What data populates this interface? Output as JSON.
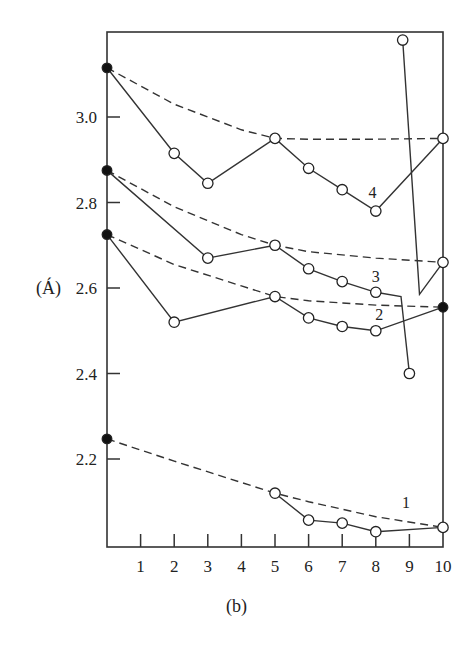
{
  "chart_data": {
    "type": "line",
    "title": "",
    "caption": "(b)",
    "xlabel": "",
    "ylabel": "(Á)",
    "xlim": [
      0,
      10
    ],
    "ylim": [
      1.98,
      3.22
    ],
    "x_ticks": [
      1,
      2,
      3,
      4,
      5,
      6,
      7,
      8,
      9,
      10
    ],
    "y_ticks": [
      2.2,
      2.4,
      2.6,
      2.8,
      3.0
    ],
    "y_tick_labels": [
      "2.2",
      "2.4",
      "2.6",
      "2.8",
      "3.0"
    ],
    "grid": false,
    "legend": "inline numeric labels 1-4",
    "series": [
      {
        "name": "1",
        "label_pos": [
          8.9,
          2.085
        ],
        "points": [
          [
            0,
            2.247,
            "filled"
          ],
          [
            5,
            2.12,
            "open"
          ],
          [
            6,
            2.057,
            "open"
          ],
          [
            7,
            2.05,
            "open"
          ],
          [
            8,
            2.03,
            "open"
          ],
          [
            10,
            2.04,
            "open"
          ]
        ],
        "solid_from_index": 1,
        "dashed_fit": [
          [
            0,
            2.247
          ],
          [
            2,
            2.195
          ],
          [
            4,
            2.145
          ],
          [
            5,
            2.12
          ],
          [
            6,
            2.1
          ],
          [
            8,
            2.065
          ],
          [
            10,
            2.04
          ]
        ]
      },
      {
        "name": "2",
        "label_pos": [
          8.1,
          2.525
        ],
        "points": [
          [
            0,
            2.725,
            "filled"
          ],
          [
            2,
            2.52,
            "open"
          ],
          [
            5,
            2.58,
            "open"
          ],
          [
            6,
            2.53,
            "open"
          ],
          [
            7,
            2.51,
            "open"
          ],
          [
            8,
            2.5,
            "open"
          ],
          [
            10,
            2.555,
            "filled"
          ]
        ],
        "solid_from_index": 0,
        "dashed_fit": [
          [
            0,
            2.725
          ],
          [
            2,
            2.655
          ],
          [
            4,
            2.605
          ],
          [
            5,
            2.58
          ],
          [
            6,
            2.57
          ],
          [
            8,
            2.56
          ],
          [
            10,
            2.555
          ]
        ]
      },
      {
        "name": "3",
        "label_pos": [
          8.0,
          2.615
        ],
        "points": [
          [
            0,
            2.875,
            "filled"
          ],
          [
            3,
            2.67,
            "open"
          ],
          [
            5,
            2.7,
            "open"
          ],
          [
            6,
            2.645,
            "open"
          ],
          [
            7,
            2.615,
            "open"
          ],
          [
            8,
            2.59,
            "open"
          ],
          [
            8.75,
            2.58,
            "none"
          ],
          [
            9,
            2.4,
            "open"
          ]
        ],
        "solid_from_index": 0,
        "dashed_fit": [
          [
            0,
            2.875
          ],
          [
            2,
            2.79
          ],
          [
            4,
            2.725
          ],
          [
            5,
            2.7
          ],
          [
            6,
            2.685
          ],
          [
            8,
            2.67
          ],
          [
            10,
            2.66
          ]
        ]
      },
      {
        "name": "4",
        "label_pos": [
          7.9,
          2.81
        ],
        "points": [
          [
            0,
            3.115,
            "filled"
          ],
          [
            2,
            2.915,
            "open"
          ],
          [
            3,
            2.845,
            "open"
          ],
          [
            5,
            2.95,
            "open"
          ],
          [
            6,
            2.88,
            "open"
          ],
          [
            7,
            2.83,
            "open"
          ],
          [
            8,
            2.78,
            "open"
          ],
          [
            10,
            2.95,
            "open"
          ]
        ],
        "solid_from_index": 0,
        "dashed_fit": [
          [
            0,
            3.115
          ],
          [
            2,
            3.03
          ],
          [
            4,
            2.97
          ],
          [
            5,
            2.95
          ],
          [
            6,
            2.948
          ],
          [
            8,
            2.948
          ],
          [
            10,
            2.95
          ]
        ]
      },
      {
        "name": "4-branch",
        "points": [
          [
            8.8,
            3.18,
            "open"
          ],
          [
            9.3,
            2.585,
            "none"
          ],
          [
            10,
            2.66,
            "open"
          ]
        ],
        "solid_from_index": 0
      }
    ]
  }
}
